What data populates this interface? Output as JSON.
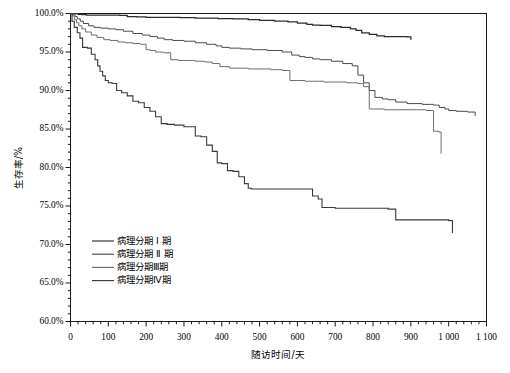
{
  "chart_data": {
    "type": "line",
    "title": "",
    "subtitle": "",
    "xlabel": "随访时间/天",
    "ylabel": "生存率/%",
    "xlim": [
      0,
      1100
    ],
    "ylim": [
      60,
      100
    ],
    "grid": false,
    "legend_position": "lower-left-inside",
    "x_ticks": [
      "0",
      "100",
      "200",
      "300",
      "400",
      "500",
      "600",
      "700",
      "800",
      "900",
      "1 000",
      "1 100"
    ],
    "x_tick_values": [
      0,
      100,
      200,
      300,
      400,
      500,
      600,
      700,
      800,
      900,
      1000,
      1100
    ],
    "x_minor_tick_step": 20,
    "y_ticks": [
      "60.0%",
      "65.0%",
      "70.0%",
      "75.0%",
      "80.0%",
      "85.0%",
      "90.0%",
      "95.0%",
      "100.0%"
    ],
    "y_tick_values": [
      60,
      65,
      70,
      75,
      80,
      85,
      90,
      95,
      100
    ],
    "y_minor_tick_step": 1,
    "curve_style": "kaplan-meier-step",
    "series": [
      {
        "name": "病理分期Ⅰ期",
        "legend_label": "病理分期 Ⅰ 期",
        "color": "#2b2b2b",
        "width": 1.25,
        "x": [
          0,
          8,
          20,
          30,
          42,
          130,
          150,
          175,
          200,
          245,
          290,
          330,
          390,
          430,
          470,
          500,
          540,
          575,
          600,
          625,
          640,
          660,
          690,
          715,
          740,
          755,
          770,
          790,
          810,
          830,
          860,
          890,
          900
        ],
        "y": [
          100.0,
          100.0,
          99.9,
          99.85,
          99.8,
          99.75,
          99.6,
          99.55,
          99.5,
          99.5,
          99.45,
          99.4,
          99.35,
          99.3,
          99.2,
          99.1,
          99.0,
          98.9,
          98.75,
          98.6,
          98.5,
          98.45,
          98.3,
          98.2,
          98.0,
          97.8,
          97.5,
          97.3,
          97.1,
          97.0,
          97.0,
          96.95,
          96.6
        ]
      },
      {
        "name": "病理分期Ⅱ期",
        "legend_label": "病理分期 Ⅱ 期",
        "color": "#4a4a4a",
        "width": 1.0,
        "x": [
          0,
          6,
          12,
          18,
          26,
          34,
          48,
          62,
          80,
          100,
          120,
          140,
          165,
          190,
          210,
          230,
          248,
          270,
          300,
          330,
          360,
          385,
          400,
          420,
          450,
          480,
          520,
          560,
          585,
          605,
          620,
          640,
          660,
          690,
          720,
          745,
          760,
          775,
          790,
          805,
          825,
          840,
          860,
          890,
          930,
          960,
          975,
          990,
          1000,
          1020,
          1050,
          1070
        ],
        "y": [
          100.0,
          99.9,
          99.6,
          99.3,
          99.0,
          98.7,
          98.4,
          98.2,
          98.1,
          98.0,
          97.9,
          97.7,
          97.4,
          97.2,
          97.0,
          96.8,
          96.6,
          96.5,
          96.4,
          96.2,
          96.0,
          95.8,
          95.6,
          95.5,
          95.4,
          95.3,
          95.2,
          95.0,
          94.6,
          94.4,
          94.3,
          94.1,
          94.0,
          93.8,
          93.5,
          93.2,
          92.0,
          91.0,
          90.0,
          89.1,
          88.9,
          88.8,
          88.5,
          88.3,
          88.2,
          88.1,
          87.8,
          87.6,
          87.4,
          87.3,
          87.2,
          86.7
        ]
      },
      {
        "name": "病理分期Ⅲ期",
        "legend_label": "病理分期Ⅲ期",
        "color": "#6e6e6e",
        "width": 1.0,
        "x": [
          0,
          5,
          10,
          16,
          22,
          30,
          40,
          55,
          70,
          88,
          105,
          125,
          145,
          165,
          185,
          200,
          210,
          225,
          245,
          265,
          285,
          305,
          330,
          355,
          375,
          395,
          420,
          445,
          470,
          500,
          530,
          560,
          580,
          600,
          620,
          640,
          655,
          670,
          690,
          710,
          730,
          745,
          760,
          775,
          790,
          810,
          830,
          860,
          900,
          940,
          960,
          975,
          980
        ],
        "y": [
          100.0,
          99.7,
          99.2,
          98.8,
          98.4,
          98.0,
          97.6,
          97.2,
          96.9,
          96.6,
          96.5,
          96.3,
          96.2,
          96.1,
          96.0,
          95.3,
          95.2,
          95.0,
          94.9,
          94.0,
          93.9,
          93.9,
          93.8,
          93.7,
          93.5,
          93.1,
          92.9,
          92.9,
          92.8,
          92.8,
          92.7,
          92.6,
          91.3,
          91.3,
          91.2,
          91.2,
          91.2,
          91.1,
          91.1,
          91.1,
          91.0,
          91.0,
          90.9,
          90.5,
          87.6,
          87.6,
          87.5,
          87.5,
          87.5,
          87.4,
          84.7,
          84.6,
          81.8
        ]
      },
      {
        "name": "病理分期Ⅳ期",
        "legend_label": "病理分期Ⅳ期",
        "color": "#3a3a3a",
        "width": 1.1,
        "x": [
          0,
          4,
          10,
          18,
          25,
          32,
          45,
          55,
          65,
          72,
          78,
          85,
          92,
          100,
          110,
          122,
          135,
          150,
          165,
          180,
          195,
          210,
          225,
          240,
          255,
          275,
          300,
          330,
          345,
          360,
          375,
          388,
          400,
          415,
          430,
          445,
          460,
          470,
          478,
          500,
          560,
          620,
          640,
          655,
          665,
          700,
          760,
          800,
          840,
          860,
          900,
          960,
          1000,
          1010
        ],
        "y": [
          100.0,
          99.0,
          98.2,
          97.5,
          96.8,
          95.6,
          95.5,
          94.7,
          94.0,
          93.2,
          92.5,
          91.9,
          91.3,
          91.0,
          90.9,
          90.0,
          89.7,
          89.3,
          88.6,
          88.4,
          87.8,
          87.3,
          86.6,
          85.7,
          85.6,
          85.5,
          85.3,
          84.1,
          84.0,
          82.9,
          82.1,
          80.6,
          80.5,
          79.6,
          79.5,
          78.8,
          77.9,
          77.3,
          77.2,
          77.2,
          77.2,
          77.2,
          76.3,
          75.9,
          74.8,
          74.7,
          74.7,
          74.7,
          74.6,
          73.2,
          73.2,
          73.2,
          73.1,
          71.5
        ]
      }
    ]
  },
  "legend": {
    "items": [
      {
        "label": "病理分期 Ⅰ 期",
        "color": "#2b2b2b"
      },
      {
        "label": "病理分期 Ⅱ 期",
        "color": "#4a4a4a"
      },
      {
        "label": "病理分期Ⅲ期",
        "color": "#6e6e6e"
      },
      {
        "label": "病理分期Ⅳ期",
        "color": "#3a3a3a"
      }
    ]
  },
  "axes": {
    "x_title": "随访时间/天",
    "y_title": "生存率/%"
  }
}
